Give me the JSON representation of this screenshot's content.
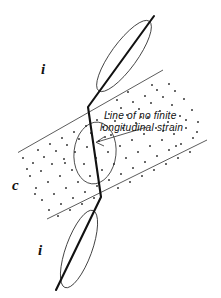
{
  "figure": {
    "kind": "structural-geology-strain-diagram",
    "title_text": "",
    "background_color": "#ffffff",
    "ink_color": "#111111",
    "band_line_color": "#4a4a4a",
    "stipple_color": "#2b2b2b"
  },
  "annotations": {
    "caption_line_1": "Line of no finite",
    "caption_line_2": "longitudinal  strain",
    "label_i_top": "i",
    "label_i_bottom": "i",
    "label_c": "c"
  },
  "geometry": {
    "deformed_line": {
      "description": "line of no finite longitudinal strain",
      "points": "154,16 88,107 101,197 56,290"
    },
    "shear_zone_band": {
      "upper_boundary": "18,152 163,70",
      "lower_boundary": "47,219 207,140"
    },
    "strain_ellipses": [
      {
        "position": "outside-upper",
        "cx": 124,
        "cy": 56,
        "rx": 13,
        "ry": 43,
        "rotation": 36
      },
      {
        "position": "inside-shear-zone",
        "cx": 95,
        "cy": 153,
        "rx": 21,
        "ry": 31,
        "rotation": 6
      },
      {
        "position": "outside-lower",
        "cx": 79,
        "cy": 249,
        "rx": 13,
        "ry": 41,
        "rotation": 20
      }
    ],
    "leader_arrow": {
      "from": "147,127",
      "to": "96,142"
    }
  }
}
